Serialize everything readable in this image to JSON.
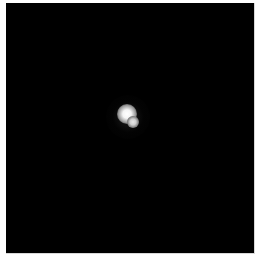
{
  "image": {
    "description": "Dark field with two bright blurred point sources near center",
    "background_color": "#000000",
    "border_color": "#ffffff",
    "sources": [
      {
        "label": "primary",
        "color": "#ffffff"
      },
      {
        "label": "secondary",
        "color": "#e0e0e0"
      }
    ]
  }
}
